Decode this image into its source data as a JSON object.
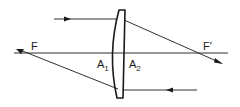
{
  "diagram": {
    "type": "thin lens ray diagram",
    "labels": {
      "object_focus": "F",
      "image_focus": "F′",
      "vertex_left": "A",
      "vertex_left_sub": "1",
      "vertex_right": "A",
      "vertex_right_sub": "2"
    },
    "colors": {
      "line": "#1a1a1a",
      "background": "#ffffff"
    }
  }
}
